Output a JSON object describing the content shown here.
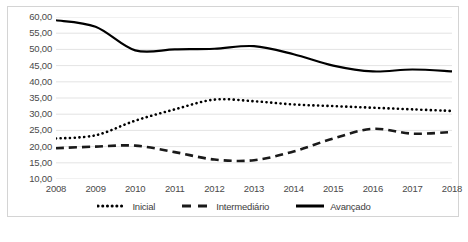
{
  "chart_data": {
    "type": "line",
    "title": "",
    "xlabel": "",
    "ylabel": "",
    "categories": [
      "2008",
      "2009",
      "2010",
      "2011",
      "2012",
      "2013",
      "2014",
      "2015",
      "2016",
      "2017",
      "2018"
    ],
    "ylim": [
      10,
      60
    ],
    "ytick_labels": [
      "60,00",
      "55,00",
      "50,00",
      "45,00",
      "40,00",
      "35,00",
      "30,00",
      "25,00",
      "20,00",
      "15,00",
      "10,00"
    ],
    "ytick_values": [
      60,
      55,
      50,
      45,
      40,
      35,
      30,
      25,
      20,
      15,
      10
    ],
    "grid": true,
    "legend_position": "bottom",
    "series": [
      {
        "name": "Inicial",
        "style": "dotted",
        "color": "#000000",
        "values": [
          22.5,
          23.5,
          28.0,
          31.5,
          34.5,
          34.0,
          33.0,
          32.5,
          32.0,
          31.5,
          31.0
        ]
      },
      {
        "name": "Intermediário",
        "style": "dashed",
        "color": "#1a1a1a",
        "values": [
          19.5,
          20.0,
          20.3,
          18.3,
          16.0,
          15.8,
          18.5,
          22.5,
          25.5,
          24.0,
          24.5
        ]
      },
      {
        "name": "Avançado",
        "style": "solid",
        "color": "#000000",
        "values": [
          59.0,
          57.0,
          49.7,
          50.0,
          50.2,
          51.0,
          48.5,
          45.0,
          43.2,
          43.8,
          43.2
        ]
      }
    ]
  },
  "legend": {
    "items": [
      {
        "label": "Inicial"
      },
      {
        "label": "Intermediário"
      },
      {
        "label": "Avançado"
      }
    ]
  }
}
